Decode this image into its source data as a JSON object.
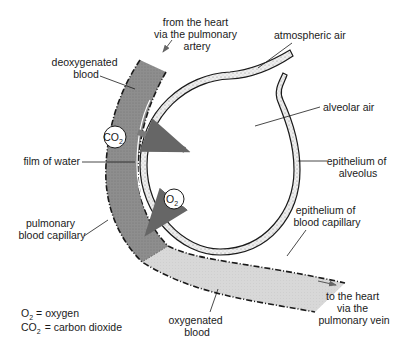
{
  "diagram": {
    "labels": {
      "from_heart": [
        "from the heart",
        "via the pulmonary",
        "artery"
      ],
      "atmospheric_air": "atmospheric air",
      "deoxygenated_blood": [
        "deoxygenated",
        "blood"
      ],
      "alveolar_air": "alveolar air",
      "film_of_water": "film of water",
      "epithelium_alveolus": [
        "epithelium of",
        "alveolus"
      ],
      "pulmonary_capillary": [
        "pulmonary",
        "blood capillary"
      ],
      "epithelium_capillary": [
        "epithelium of",
        "blood capillary"
      ],
      "oxygenated_blood": [
        "oxygenated",
        "blood"
      ],
      "to_heart": [
        "to the heart",
        "via the",
        "pulmonary vein"
      ]
    },
    "molecules": {
      "co2": {
        "main": "CO",
        "sub": "2"
      },
      "o2": {
        "main": "O",
        "sub": "2"
      }
    },
    "legend": [
      {
        "symbol_main": "O",
        "symbol_sub": "2",
        "text": "= oxygen"
      },
      {
        "symbol_main": "CO",
        "symbol_sub": "2",
        "text": "= carbon dioxide"
      }
    ],
    "colors": {
      "deoxygenated": "#8c8c8c",
      "oxygenated": "#d6d6d6",
      "wall_stipple": "#e6e6e6",
      "arrow": "#7a7a7a",
      "ink": "#1a1a1a"
    }
  }
}
